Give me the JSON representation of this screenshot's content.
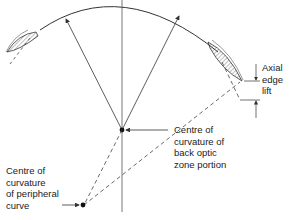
{
  "diagram": {
    "type": "contact-lens-cross-section",
    "labels": {
      "axial_edge_lift": [
        "Axial",
        "edge",
        "lift"
      ],
      "centre_back_optic": [
        "Centre of",
        "curvature of",
        "back optic",
        "zone portion"
      ],
      "centre_peripheral": [
        "Centre of",
        "curvature",
        "of peripheral",
        "curve"
      ]
    },
    "colors": {
      "line": "#333333",
      "background": "#ffffff"
    }
  }
}
